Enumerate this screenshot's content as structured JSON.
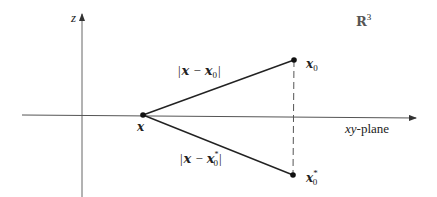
{
  "diagram": {
    "space_label": "ℝ³",
    "space_label_base": "R",
    "space_label_exp": "3",
    "z_axis_label": "z",
    "plane_label_italic": "xy",
    "plane_label_suffix": "-plane",
    "point_x_label": "x",
    "point_x0_label": "x",
    "point_x0_sub": "0",
    "point_x0star_label": "x",
    "point_x0star_sub": "0",
    "point_x0star_sup": "*",
    "dist_upper": {
      "open": "|",
      "a": "x",
      "op": "−",
      "b": "x",
      "b_sub": "0",
      "close": "|"
    },
    "dist_lower": {
      "open": "|",
      "a": "x",
      "op": "−",
      "b": "x",
      "b_sub": "0",
      "b_sup": "*",
      "close": "|"
    },
    "colors": {
      "stroke": "#222222",
      "axis": "#555555",
      "background": "#ffffff"
    }
  }
}
